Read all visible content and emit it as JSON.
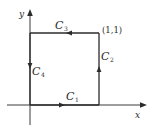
{
  "diagram": {
    "type": "closed-curve-on-axes",
    "axes": {
      "x_label": "x",
      "y_label": "y"
    },
    "corner_label": "(1,1)",
    "curves": [
      {
        "name": "C1",
        "label_main": "C",
        "label_sub": "1",
        "segment": "bottom (0,0)->(1,0)",
        "direction": "right"
      },
      {
        "name": "C2",
        "label_main": "C",
        "label_sub": "2",
        "segment": "right (1,0)->(1,1)",
        "direction": "up"
      },
      {
        "name": "C3",
        "label_main": "C",
        "label_sub": "3",
        "segment": "top (1,1)->(0,1)",
        "direction": "left"
      },
      {
        "name": "C4",
        "label_main": "C",
        "label_sub": "4",
        "segment": "left (0,1)->(0,0)",
        "direction": "down"
      }
    ],
    "colors": {
      "ink": "#2b2b2b",
      "background": "#ffffff"
    }
  }
}
